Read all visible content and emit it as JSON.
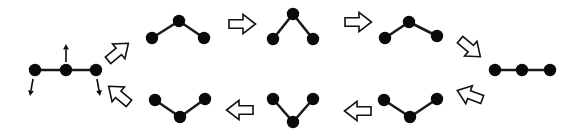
{
  "figure": {
    "background_color": "#ffffff",
    "node_color": "#0a0a0a",
    "bond_color": "#1a1a1a",
    "arrow_fill": "#ffffff",
    "arrow_stroke": "#111111",
    "node_radius": 6.2,
    "bond_width": 2.6,
    "width": 582,
    "height": 135
  },
  "states": [
    {
      "id": "state-flat-left",
      "label": "flat chain with motion arrows",
      "nodes": [
        {
          "name": "node-left",
          "x": 35,
          "y": 70
        },
        {
          "name": "node-center",
          "x": 66,
          "y": 70
        },
        {
          "name": "node-right",
          "x": 96,
          "y": 70
        }
      ],
      "bonds": [
        [
          0,
          1
        ],
        [
          1,
          2
        ]
      ],
      "motion_arrows": [
        {
          "name": "motion-arrow-up-center",
          "x1": 66,
          "y1": 62,
          "x2": 66,
          "y2": 44
        },
        {
          "name": "motion-arrow-down-left",
          "x1": 33,
          "y1": 79,
          "x2": 30,
          "y2": 96
        },
        {
          "name": "motion-arrow-down-right",
          "x1": 97,
          "y1": 79,
          "x2": 100,
          "y2": 96
        }
      ]
    },
    {
      "id": "state-shallow-peak-top-left",
      "label": "shallow inverted-V",
      "nodes": [
        {
          "name": "node-left",
          "x": 152,
          "y": 38
        },
        {
          "name": "node-center",
          "x": 179,
          "y": 21
        },
        {
          "name": "node-right",
          "x": 204,
          "y": 38
        }
      ],
      "bonds": [
        [
          0,
          1
        ],
        [
          1,
          2
        ]
      ],
      "motion_arrows": []
    },
    {
      "id": "state-steep-peak-top-middle",
      "label": "steep inverted-V",
      "nodes": [
        {
          "name": "node-left",
          "x": 273,
          "y": 39
        },
        {
          "name": "node-center",
          "x": 293,
          "y": 14
        },
        {
          "name": "node-right",
          "x": 313,
          "y": 39
        }
      ],
      "bonds": [
        [
          0,
          1
        ],
        [
          1,
          2
        ]
      ],
      "motion_arrows": []
    },
    {
      "id": "state-shallow-peak-top-right",
      "label": "shallow inverted-V returning",
      "nodes": [
        {
          "name": "node-left",
          "x": 385,
          "y": 38
        },
        {
          "name": "node-center",
          "x": 409,
          "y": 22
        },
        {
          "name": "node-right",
          "x": 437,
          "y": 36
        }
      ],
      "bonds": [
        [
          0,
          1
        ],
        [
          1,
          2
        ]
      ],
      "motion_arrows": []
    },
    {
      "id": "state-flat-right",
      "label": "flat chain",
      "nodes": [
        {
          "name": "node-left",
          "x": 495,
          "y": 70
        },
        {
          "name": "node-center",
          "x": 522,
          "y": 70
        },
        {
          "name": "node-right",
          "x": 550,
          "y": 70
        }
      ],
      "bonds": [
        [
          0,
          1
        ],
        [
          1,
          2
        ]
      ],
      "motion_arrows": []
    },
    {
      "id": "state-shallow-valley-bottom-right",
      "label": "shallow V",
      "nodes": [
        {
          "name": "node-left",
          "x": 384,
          "y": 100
        },
        {
          "name": "node-center",
          "x": 410,
          "y": 117
        },
        {
          "name": "node-right",
          "x": 437,
          "y": 99
        }
      ],
      "bonds": [
        [
          0,
          1
        ],
        [
          1,
          2
        ]
      ],
      "motion_arrows": []
    },
    {
      "id": "state-steep-valley-bottom-middle",
      "label": "steep V",
      "nodes": [
        {
          "name": "node-left",
          "x": 273,
          "y": 99
        },
        {
          "name": "node-center",
          "x": 293,
          "y": 122
        },
        {
          "name": "node-right",
          "x": 313,
          "y": 99
        }
      ],
      "bonds": [
        [
          0,
          1
        ],
        [
          1,
          2
        ]
      ],
      "motion_arrows": []
    },
    {
      "id": "state-shallow-valley-bottom-left",
      "label": "shallow V returning",
      "nodes": [
        {
          "name": "node-left",
          "x": 155,
          "y": 100
        },
        {
          "name": "node-center",
          "x": 180,
          "y": 117
        },
        {
          "name": "node-right",
          "x": 205,
          "y": 99
        }
      ],
      "bonds": [
        [
          0,
          1
        ],
        [
          1,
          2
        ]
      ],
      "motion_arrows": []
    }
  ],
  "transition_arrows": [
    {
      "name": "transition-arrow-up-right",
      "x": 118,
      "y": 52,
      "angle": -40,
      "scale": 1.0,
      "direction": "up-right"
    },
    {
      "name": "transition-arrow-right-top-1",
      "x": 242,
      "y": 24,
      "angle": 0,
      "scale": 1.0,
      "direction": "right"
    },
    {
      "name": "transition-arrow-right-top-2",
      "x": 358,
      "y": 22,
      "angle": 0,
      "scale": 1.0,
      "direction": "right"
    },
    {
      "name": "transition-arrow-down-right",
      "x": 470,
      "y": 48,
      "angle": 40,
      "scale": 1.0,
      "direction": "down-right"
    },
    {
      "name": "transition-arrow-down-left",
      "x": 470,
      "y": 95,
      "angle": 200,
      "scale": 1.0,
      "direction": "down-left"
    },
    {
      "name": "transition-arrow-left-bottom-1",
      "x": 358,
      "y": 111,
      "angle": 180,
      "scale": 1.0,
      "direction": "left"
    },
    {
      "name": "transition-arrow-left-bottom-2",
      "x": 240,
      "y": 110,
      "angle": 180,
      "scale": 1.0,
      "direction": "left"
    },
    {
      "name": "transition-arrow-up-left",
      "x": 119,
      "y": 95,
      "angle": 220,
      "scale": 1.0,
      "direction": "up-left"
    }
  ]
}
